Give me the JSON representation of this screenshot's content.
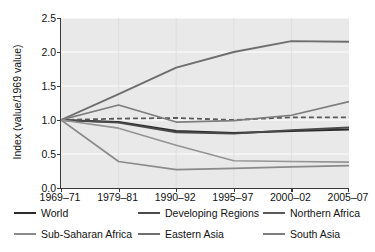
{
  "chart_data": {
    "type": "line",
    "title": "",
    "xlabel": "",
    "ylabel": "Index  (value/1969 value)",
    "categories": [
      "1969–71",
      "1979–81",
      "1990–92",
      "1995–97",
      "2000–02",
      "2005–07"
    ],
    "ylim": [
      0.0,
      2.5
    ],
    "yticks": [
      "0.0",
      "0.5",
      "1.0",
      "1.5",
      "2.0",
      "2.5"
    ],
    "ytick_values": [
      0.0,
      0.5,
      1.0,
      1.5,
      2.0,
      2.5
    ],
    "grid": "horizontal",
    "legend_position": "below",
    "plot_background": "#e9e9e9",
    "series": [
      {
        "name": "World",
        "color": "#2b2b2b",
        "style": "solid",
        "width": 2.0,
        "values": [
          1.0,
          0.97,
          0.84,
          0.81,
          0.84,
          0.86
        ]
      },
      {
        "name": "Developing Regions",
        "color": "#4a4a4a",
        "style": "solid",
        "width": 1.8,
        "values": [
          1.0,
          0.96,
          0.82,
          0.8,
          0.85,
          0.89
        ]
      },
      {
        "name": "Northern Africa",
        "color": "#5a5a5a",
        "style": "dashed",
        "width": 1.8,
        "values": [
          1.0,
          1.02,
          1.03,
          1.0,
          1.04,
          1.04
        ]
      },
      {
        "name": "Sub-Saharan Africa",
        "color": "#8a8a8a",
        "style": "solid",
        "width": 1.7,
        "values": [
          1.0,
          0.39,
          0.27,
          0.29,
          0.31,
          0.33
        ]
      },
      {
        "name": "Eastern Asia",
        "color": "#6e6e6e",
        "style": "solid",
        "width": 1.9,
        "values": [
          1.0,
          1.38,
          1.77,
          2.0,
          2.16,
          2.15
        ]
      },
      {
        "name": "South Asia",
        "color": "#7d7d7d",
        "style": "solid",
        "width": 1.7,
        "values": [
          1.0,
          1.22,
          0.97,
          0.99,
          1.07,
          1.27
        ]
      },
      {
        "name": "",
        "color": "#949494",
        "style": "solid",
        "width": 1.6,
        "legend": false,
        "values": [
          1.0,
          0.88,
          0.63,
          0.4,
          0.39,
          0.38
        ]
      }
    ]
  },
  "legend": {
    "rows": [
      [
        {
          "label": "World",
          "color": "#2b2b2b",
          "style": "solid",
          "x": 14
        },
        {
          "label": "Developing Regions",
          "color": "#4a4a4a",
          "style": "solid",
          "x": 138
        },
        {
          "label": "Northern Africa",
          "color": "#5a5a5a",
          "style": "solid",
          "x": 263
        }
      ],
      [
        {
          "label": "Sub-Saharan Africa",
          "color": "#8a8a8a",
          "style": "solid",
          "x": 14
        },
        {
          "label": "Eastern Asia",
          "color": "#6e6e6e",
          "style": "solid",
          "x": 138
        },
        {
          "label": "South Asia",
          "color": "#7d7d7d",
          "style": "solid",
          "x": 263
        }
      ]
    ]
  }
}
